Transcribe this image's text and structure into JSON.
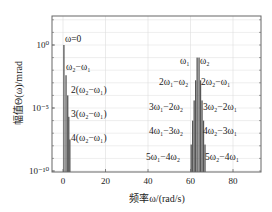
{
  "chart_data": {
    "type": "bar",
    "title": "",
    "xlabel": "频率ω/(rad/s)",
    "ylabel": "幅值Θ(ω)/mrad",
    "yscale": "log",
    "xlim": [
      -5,
      93
    ],
    "ylim_log10": [
      -10,
      2.3
    ],
    "grid": true,
    "legend": null,
    "x_ticks": [
      0,
      20,
      40,
      60,
      80
    ],
    "x_tick_labels": [
      "0",
      "20",
      "40",
      "60",
      "80"
    ],
    "y_ticks_log10": [
      0,
      -5,
      -10
    ],
    "y_tick_labels": [
      "10⁰",
      "10⁻⁵",
      "10⁻¹⁰"
    ],
    "series": [
      {
        "name": "low-frequency components",
        "x": [
          0.4,
          1.4,
          2.2,
          2.7,
          3.2
        ],
        "log10_values": [
          0,
          -2.4,
          -4.0,
          -5.7,
          -7.5
        ],
        "labels": [
          "ω=0",
          "ω₂−ω₁",
          "2(ω₂−ω₁)",
          "3(ω₂−ω₁)",
          "4(ω₂−ω₁)"
        ]
      },
      {
        "name": "high-frequency components",
        "x": [
          60.3,
          61.0,
          61.7,
          62.4,
          63.1,
          64.0,
          64.7,
          65.4,
          66.1,
          66.8
        ],
        "log10_values": [
          -7.9,
          -6.0,
          -4.4,
          -2.8,
          -1.0,
          -1.0,
          -2.8,
          -4.4,
          -6.0,
          -7.9
        ],
        "labels": [
          "5ω₁−4ω₂",
          "4ω₁−3ω₂",
          "3ω₁−2ω₂",
          "2ω₁−ω₂",
          "ω₁",
          "ω₂",
          "2ω₂−ω₁",
          "3ω₂−2ω₁",
          "4ω₂−3ω₁",
          "5ω₂−4ω₁"
        ]
      }
    ],
    "annotations": [
      {
        "text": "ω=0",
        "x": 65,
        "y": 42
      },
      {
        "text": "ω₂−ω₁",
        "x": 66,
        "y": 70
      },
      {
        "text": "2(ω₂−ω₁)",
        "x": 71,
        "y": 93
      },
      {
        "text": "3(ω₂−ω₁)",
        "x": 71,
        "y": 117
      },
      {
        "text": "4(ω₂−ω₁)",
        "x": 71,
        "y": 141
      },
      {
        "text": "ω₁",
        "x": 180,
        "y": 64
      },
      {
        "text": "ω₂",
        "x": 200,
        "y": 64
      },
      {
        "text": "2ω₁−ω₂",
        "x": 159,
        "y": 85
      },
      {
        "text": "2ω₂−ω₁",
        "x": 201,
        "y": 85
      },
      {
        "text": "3ω₁−2ω₂",
        "x": 149,
        "y": 110
      },
      {
        "text": "3ω₂−2ω₁",
        "x": 203,
        "y": 110
      },
      {
        "text": "4ω₁−3ω₂",
        "x": 149,
        "y": 134
      },
      {
        "text": "4ω₂−3ω₁",
        "x": 203,
        "y": 134
      },
      {
        "text": "5ω₁−4ω₂",
        "x": 146,
        "y": 160
      },
      {
        "text": "5ω₂−4ω₁",
        "x": 205,
        "y": 160
      }
    ]
  },
  "colors": {
    "bar": "#555555",
    "axis": "#666666",
    "grid": "#dddddd",
    "text": "#222222"
  }
}
